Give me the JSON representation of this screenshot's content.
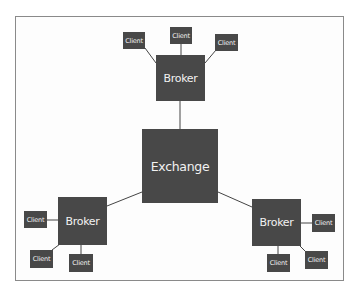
{
  "diagram": {
    "type": "hierarchy-network",
    "colors": {
      "node_fill": "#484848",
      "node_text": "#f2f2f2",
      "edge": "#444444",
      "frame": "#8a8a8a"
    },
    "exchange": {
      "label": "Exchange",
      "box": [
        142,
        129,
        76,
        74
      ]
    },
    "brokers": [
      {
        "label": "Broker",
        "position": "top",
        "box": [
          156,
          55,
          49,
          46
        ]
      },
      {
        "label": "Broker",
        "position": "left",
        "box": [
          58,
          197,
          49,
          48
        ]
      },
      {
        "label": "Broker",
        "position": "right",
        "box": [
          252,
          199,
          49,
          47
        ]
      }
    ],
    "clients": [
      {
        "label": "Client",
        "broker": 0,
        "box": [
          123,
          32,
          22,
          17
        ]
      },
      {
        "label": "Client",
        "broker": 0,
        "box": [
          170,
          27,
          22,
          17
        ]
      },
      {
        "label": "Client",
        "broker": 0,
        "box": [
          215,
          34,
          23,
          17
        ]
      },
      {
        "label": "Client",
        "broker": 1,
        "box": [
          24,
          211,
          23,
          17
        ]
      },
      {
        "label": "Client",
        "broker": 1,
        "box": [
          30,
          250,
          23,
          18
        ]
      },
      {
        "label": "Client",
        "broker": 1,
        "box": [
          69,
          254,
          24,
          18
        ]
      },
      {
        "label": "Client",
        "broker": 2,
        "box": [
          312,
          214,
          23,
          18
        ]
      },
      {
        "label": "Client",
        "broker": 2,
        "box": [
          267,
          254,
          23,
          18
        ]
      },
      {
        "label": "Client",
        "broker": 2,
        "box": [
          305,
          251,
          23,
          18
        ]
      }
    ],
    "edges": [
      [
        "exchange",
        "broker-0"
      ],
      [
        "exchange",
        "broker-1"
      ],
      [
        "exchange",
        "broker-2"
      ],
      [
        "broker-0",
        "client-0"
      ],
      [
        "broker-0",
        "client-1"
      ],
      [
        "broker-0",
        "client-2"
      ],
      [
        "broker-1",
        "client-3"
      ],
      [
        "broker-1",
        "client-4"
      ],
      [
        "broker-1",
        "client-5"
      ],
      [
        "broker-2",
        "client-6"
      ],
      [
        "broker-2",
        "client-7"
      ],
      [
        "broker-2",
        "client-8"
      ]
    ]
  }
}
